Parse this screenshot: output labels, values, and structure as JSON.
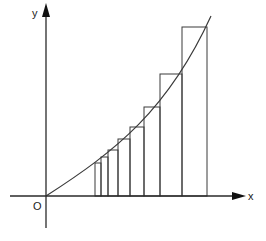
{
  "diagram": {
    "title": "",
    "labels": {
      "y_axis": "y",
      "x_axis": "x",
      "origin": "O"
    },
    "colors": {
      "stroke": "#3a3a3a",
      "background": "#ffffff"
    },
    "origin_px": [
      46,
      196
    ],
    "curve_end_px": [
      208,
      20
    ],
    "rectangles": [
      {
        "x0": 95,
        "x1": 101,
        "top": 163
      },
      {
        "x0": 101,
        "x1": 108,
        "top": 157
      },
      {
        "x0": 108,
        "x1": 118,
        "top": 150
      },
      {
        "x0": 118,
        "x1": 130,
        "top": 139
      },
      {
        "x0": 130,
        "x1": 144,
        "top": 127
      },
      {
        "x0": 144,
        "x1": 160,
        "top": 107
      },
      {
        "x0": 160,
        "x1": 182,
        "top": 74
      },
      {
        "x0": 182,
        "x1": 207,
        "top": 27
      }
    ]
  }
}
